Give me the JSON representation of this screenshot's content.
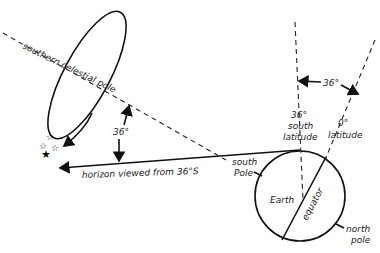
{
  "diagram": {
    "labels": {
      "celestial_pole": "southern celestial pole",
      "angle_left": "36°",
      "horizon": "horizon viewed from 36°S",
      "south_pole": "south",
      "south_pole_2": "Pole",
      "lat36_a": "36°",
      "lat36_b": "south",
      "lat36_c": "latitude",
      "lat0_a": "0°",
      "lat0_b": "latitude",
      "angle_right": "36°",
      "earth": "Earth",
      "equator": "equator",
      "north_pole_a": "north",
      "north_pole_b": "pole"
    },
    "colors": {
      "ink": "#111111",
      "background": "#ffffff"
    }
  }
}
